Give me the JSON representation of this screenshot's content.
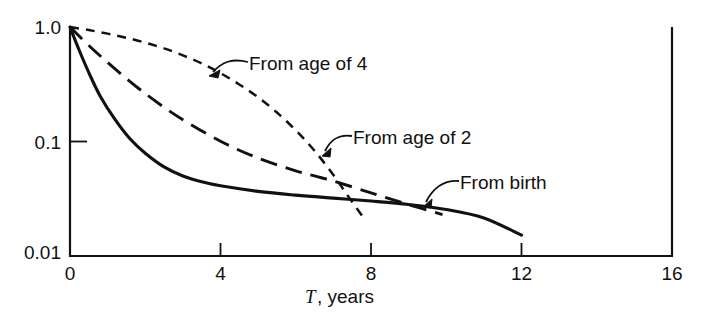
{
  "chart_data": {
    "type": "line",
    "title": "",
    "subtitle": "",
    "xlabel_math": "T",
    "xlabel_rest": ", years",
    "xlabel": "T, years",
    "ylabel": "",
    "yscale": "log",
    "xscale": "linear",
    "xlim": [
      0,
      16
    ],
    "ylim": [
      0.01,
      1.0
    ],
    "grid": false,
    "legend_position": "inline-annotations",
    "xticks": [
      0,
      4,
      8,
      12,
      16
    ],
    "xtick_labels": [
      "0",
      "4",
      "8",
      "12",
      "16"
    ],
    "yticks": [
      1.0,
      0.1,
      0.01
    ],
    "ytick_labels": [
      "1.0",
      "0.1",
      "0.01"
    ],
    "series": [
      {
        "name": "From birth",
        "style": "solid",
        "annotation": "From birth",
        "x": [
          0,
          0.25,
          0.5,
          0.8,
          1.2,
          1.6,
          2.0,
          2.5,
          3.0,
          3.5,
          4.0,
          5.0,
          6.0,
          7.0,
          8.0,
          9.0,
          10.0,
          11.0,
          12.0
        ],
        "y": [
          1.0,
          0.62,
          0.4,
          0.25,
          0.155,
          0.105,
          0.079,
          0.06,
          0.05,
          0.0445,
          0.041,
          0.0367,
          0.034,
          0.032,
          0.0302,
          0.0282,
          0.0255,
          0.0215,
          0.0152
        ]
      },
      {
        "name": "From age of 2",
        "style": "long-dash",
        "annotation": "From age of 2",
        "x": [
          0,
          0.5,
          1.0,
          1.5,
          2.0,
          2.5,
          3.0,
          4.0,
          5.0,
          6.0,
          6.5,
          7.0,
          8.0,
          9.0,
          9.9
        ],
        "y": [
          1.0,
          0.69,
          0.49,
          0.355,
          0.262,
          0.199,
          0.155,
          0.1005,
          0.0715,
          0.0555,
          0.05,
          0.0452,
          0.0356,
          0.0281,
          0.023
        ]
      },
      {
        "name": "From age of 4",
        "style": "short-dash",
        "annotation": "From age of 4",
        "x": [
          0,
          0.5,
          1.0,
          1.5,
          2.0,
          2.5,
          3.0,
          3.5,
          4.0,
          4.5,
          5.0,
          5.5,
          6.0,
          6.5,
          7.0,
          7.4,
          7.85
        ],
        "y": [
          1.0,
          0.94,
          0.875,
          0.805,
          0.73,
          0.65,
          0.565,
          0.48,
          0.395,
          0.315,
          0.243,
          0.179,
          0.1255,
          0.083,
          0.051,
          0.033,
          0.0205
        ]
      }
    ]
  },
  "annotations": [
    {
      "id": "from-age-4",
      "text": "From age of 4"
    },
    {
      "id": "from-age-2",
      "text": "From age of 2"
    },
    {
      "id": "from-birth",
      "text": "From birth"
    }
  ],
  "colors": {
    "ink": "#111111",
    "background": "#ffffff"
  }
}
